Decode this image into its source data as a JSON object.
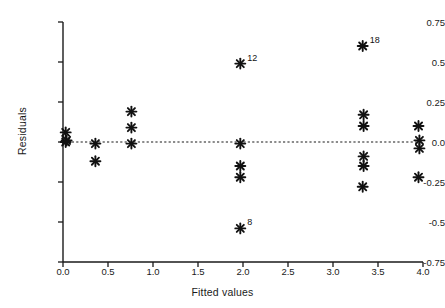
{
  "chart_data": {
    "type": "scatter",
    "title": "",
    "xlabel": "Fitted values",
    "ylabel": "Residuals",
    "xlim": [
      0.0,
      4.0
    ],
    "ylim": [
      -0.75,
      0.75
    ],
    "xticks": [
      "0.0",
      "0.5",
      "1.0",
      "1.5",
      "2.0",
      "2.5",
      "3.0",
      "3.5",
      "4.0"
    ],
    "xtick_values": [
      0.0,
      0.5,
      1.0,
      1.5,
      2.0,
      2.5,
      3.0,
      3.5,
      4.0
    ],
    "yticks": [
      "0.75",
      "0.5",
      "0.25",
      "0.0",
      "-0.25",
      "-0.5",
      "-0.75"
    ],
    "ytick_values": [
      0.75,
      0.5,
      0.25,
      0.0,
      -0.25,
      -0.5,
      -0.75
    ],
    "grid": false,
    "legend": null,
    "reference_line": {
      "orientation": "horizontal",
      "y": 0.0,
      "style": "dashed",
      "color": "#1a1a1a"
    },
    "marker": {
      "symbol": "asterisk",
      "color": "#111111"
    },
    "points": [
      {
        "x": 0.03,
        "y": 0.06,
        "label": ""
      },
      {
        "x": 0.04,
        "y": 0.01,
        "label": ""
      },
      {
        "x": 0.03,
        "y": 0.0,
        "label": ""
      },
      {
        "x": 0.36,
        "y": -0.01,
        "label": ""
      },
      {
        "x": 0.36,
        "y": -0.12,
        "label": ""
      },
      {
        "x": 0.76,
        "y": 0.19,
        "label": ""
      },
      {
        "x": 0.76,
        "y": 0.09,
        "label": ""
      },
      {
        "x": 0.76,
        "y": -0.01,
        "label": ""
      },
      {
        "x": 1.97,
        "y": 0.49,
        "label": "12"
      },
      {
        "x": 1.97,
        "y": -0.01,
        "label": ""
      },
      {
        "x": 1.97,
        "y": -0.15,
        "label": ""
      },
      {
        "x": 1.97,
        "y": -0.22,
        "label": ""
      },
      {
        "x": 1.97,
        "y": -0.54,
        "label": "8"
      },
      {
        "x": 3.33,
        "y": 0.6,
        "label": "18"
      },
      {
        "x": 3.34,
        "y": 0.17,
        "label": ""
      },
      {
        "x": 3.34,
        "y": 0.1,
        "label": ""
      },
      {
        "x": 3.34,
        "y": -0.09,
        "label": ""
      },
      {
        "x": 3.34,
        "y": -0.15,
        "label": ""
      },
      {
        "x": 3.33,
        "y": -0.28,
        "label": ""
      },
      {
        "x": 3.95,
        "y": 0.1,
        "label": ""
      },
      {
        "x": 3.96,
        "y": 0.01,
        "label": ""
      },
      {
        "x": 3.96,
        "y": -0.04,
        "label": ""
      },
      {
        "x": 3.95,
        "y": -0.22,
        "label": ""
      }
    ],
    "annotations": [
      {
        "text": "12",
        "x": 1.97,
        "y": 0.49
      },
      {
        "text": "8",
        "x": 1.97,
        "y": -0.54
      },
      {
        "text": "18",
        "x": 3.33,
        "y": 0.6
      }
    ]
  },
  "colors": {
    "axis": "#1a1a1a",
    "marker": "#111111",
    "background": "#ffffff"
  }
}
